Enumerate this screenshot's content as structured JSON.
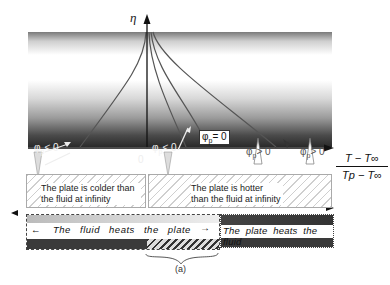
{
  "axes": {
    "y_label": "η",
    "x_label_numerator": "T − T∞",
    "x_label_denominator": "Tp − T∞",
    "origin_label": "0"
  },
  "annotations": {
    "phi_left_1": {
      "sym": "φ",
      "sub": "p",
      "rel": "< 0"
    },
    "phi_left_2": {
      "sym": "φ",
      "sub": "p",
      "rel": "< 0"
    },
    "phi_zero": {
      "sym": "φ",
      "sub": "p",
      "rel": "= 0"
    },
    "phi_right_1": {
      "sym": "φ",
      "sub": "p",
      "rel": "> 0"
    },
    "phi_right_2": {
      "sym": "φ",
      "sub": "p",
      "rel": "> 0"
    }
  },
  "regions": {
    "colder": "The plate is colder than the fluid at infinity",
    "hotter": "The plate is hotter than the fluid at infinity"
  },
  "bands": {
    "fluid_heats_plate": "The fluid heats the plate",
    "plate_heats_fluid": "The plate heats the fluid",
    "left_arrow": "←",
    "right_arrow": "→",
    "brace_label": "(a)"
  },
  "colors": {
    "curve": "#555555",
    "axis": "#111111",
    "gradient_dark": "#2a2a2a",
    "band_dark": "#3a3a3a"
  }
}
